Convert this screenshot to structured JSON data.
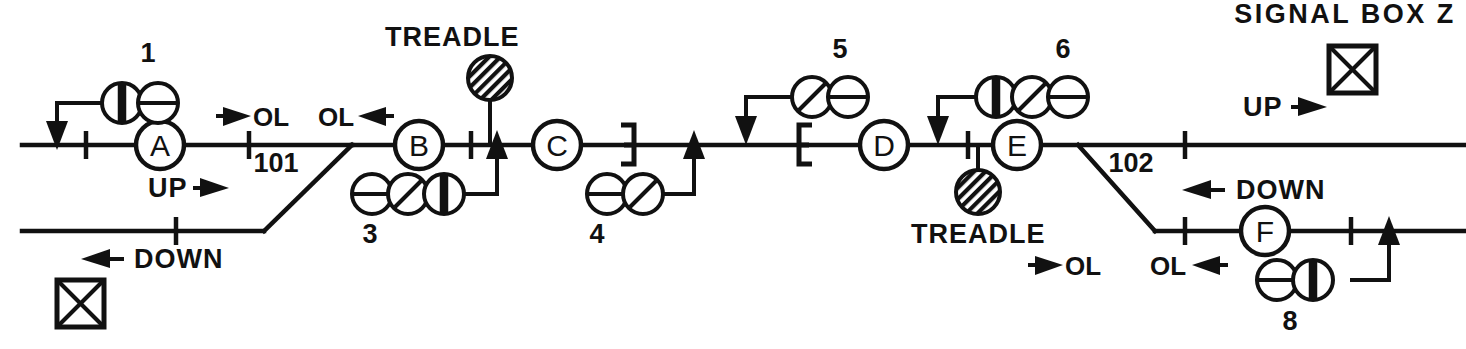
{
  "diagram": {
    "background_color": "#ffffff",
    "ink_color": "#111111",
    "signal_box": {
      "label": "SIGNAL BOX Z",
      "icon": "crossed-box-icon"
    },
    "secondary_box": {
      "label": "",
      "icon": "crossed-box-icon"
    },
    "direction_labels": [
      {
        "id": "up-left",
        "text": "UP",
        "arrow": "right"
      },
      {
        "id": "down-left",
        "text": "DOWN",
        "arrow": "left"
      },
      {
        "id": "up-right",
        "text": "UP",
        "arrow": "right"
      },
      {
        "id": "down-right",
        "text": "DOWN",
        "arrow": "left"
      }
    ],
    "overlap_labels": [
      {
        "id": "ol-1",
        "text": "OL",
        "arrow": "right",
        "arrow_side": "left"
      },
      {
        "id": "ol-2",
        "text": "OL",
        "arrow": "left",
        "arrow_side": "right"
      },
      {
        "id": "ol-3",
        "text": "OL",
        "arrow": "right",
        "arrow_side": "left"
      },
      {
        "id": "ol-4",
        "text": "OL",
        "arrow": "left",
        "arrow_side": "right"
      }
    ],
    "track_sections": [
      {
        "id": "section-101",
        "label": "101"
      },
      {
        "id": "section-102",
        "label": "102"
      }
    ],
    "track_circuits": [
      {
        "id": "tc-A",
        "letter": "A"
      },
      {
        "id": "tc-B",
        "letter": "B"
      },
      {
        "id": "tc-C",
        "letter": "C"
      },
      {
        "id": "tc-D",
        "letter": "D"
      },
      {
        "id": "tc-E",
        "letter": "E"
      },
      {
        "id": "tc-F",
        "letter": "F"
      }
    ],
    "treadles": [
      {
        "id": "treadle-upper",
        "label": "TREADLE"
      },
      {
        "id": "treadle-lower",
        "label": "TREADLE"
      }
    ],
    "signals": [
      {
        "id": "signal-1",
        "number": "1",
        "aspects": [
          "vertical-bar",
          "horizontal-bar"
        ],
        "position": "above-up-line"
      },
      {
        "id": "signal-3",
        "number": "3",
        "aspects": [
          "horizontal-bar",
          "diagonal-bar",
          "vertical-bar"
        ],
        "position": "below-up-line"
      },
      {
        "id": "signal-4",
        "number": "4",
        "aspects": [
          "horizontal-bar",
          "diagonal-bar"
        ],
        "position": "below-up-line"
      },
      {
        "id": "signal-5",
        "number": "5",
        "aspects": [
          "diagonal-bar",
          "horizontal-bar"
        ],
        "position": "above-up-line"
      },
      {
        "id": "signal-6",
        "number": "6",
        "aspects": [
          "vertical-bar",
          "diagonal-bar",
          "horizontal-bar"
        ],
        "position": "above-up-line"
      },
      {
        "id": "signal-8",
        "number": "8",
        "aspects": [
          "horizontal-bar",
          "vertical-bar"
        ],
        "position": "below-down-line"
      }
    ],
    "brackets": [
      {
        "id": "bracket-left",
        "orientation": "reversed-e"
      },
      {
        "id": "bracket-right",
        "orientation": "e"
      }
    ]
  }
}
